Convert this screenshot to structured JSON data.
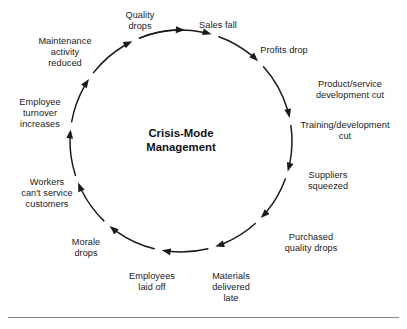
{
  "figure": {
    "background_color": "#ffffff",
    "stroke_color": "#1a1a1a",
    "text_color": "#1a1a1a"
  },
  "center": {
    "title": "Crisis-Mode\nManagement"
  },
  "chart_data": {
    "type": "diagram",
    "diagram_kind": "vicious-cycle-loop",
    "title": "Crisis-Mode Management",
    "direction": "clockwise",
    "node_count": 14,
    "circle": {
      "cx": 181,
      "cy": 141,
      "r": 111
    },
    "nodes": [
      {
        "label": "Quality\ndrops",
        "angle_deg": -70,
        "x": 112,
        "y": 10,
        "width": 56,
        "align": "center"
      },
      {
        "label": "Sales fall",
        "angle_deg": -48,
        "x": 187,
        "y": 20,
        "width": 62,
        "align": "center"
      },
      {
        "label": "Profits drop",
        "angle_deg": -22,
        "x": 249,
        "y": 45,
        "width": 70,
        "align": "center"
      },
      {
        "label": "Product/service\ndevelopment cut",
        "angle_deg": 2,
        "x": 302,
        "y": 79,
        "width": 96,
        "align": "center"
      },
      {
        "label": "Training/development\ncut",
        "angle_deg": 20,
        "x": 289,
        "y": 120,
        "width": 112,
        "align": "center"
      },
      {
        "label": "Suppliers\nsqueezed",
        "angle_deg": 44,
        "x": 298,
        "y": 170,
        "width": 60,
        "align": "center"
      },
      {
        "label": "Purchased\nquality drops",
        "angle_deg": 68,
        "x": 272,
        "y": 232,
        "width": 78,
        "align": "center"
      },
      {
        "label": "Materials\ndelivered\nlate",
        "angle_deg": 96,
        "x": 202,
        "y": 271,
        "width": 58,
        "align": "center"
      },
      {
        "label": "Employees\nlaid off",
        "angle_deg": 118,
        "x": 119,
        "y": 271,
        "width": 66,
        "align": "center"
      },
      {
        "label": "Morale\ndrops",
        "angle_deg": 140,
        "x": 60,
        "y": 237,
        "width": 52,
        "align": "center"
      },
      {
        "label": "Workers\ncan't service\ncustomers",
        "angle_deg": 166,
        "x": 8,
        "y": 177,
        "width": 78,
        "align": "center"
      },
      {
        "label": "Employee\nturnover\nincreases",
        "angle_deg": 192,
        "x": 6,
        "y": 97,
        "width": 68,
        "align": "center"
      },
      {
        "label": "Maintenance\nactivity\nreduced",
        "angle_deg": 218,
        "x": 27,
        "y": 36,
        "width": 76,
        "align": "center"
      }
    ],
    "arrow_segments": [
      {
        "from_deg": -112,
        "to_deg": -74
      },
      {
        "from_deg": -70,
        "to_deg": -46
      },
      {
        "from_deg": -42,
        "to_deg": -12
      },
      {
        "from_deg": -8,
        "to_deg": 16
      },
      {
        "from_deg": 20,
        "to_deg": 44
      },
      {
        "from_deg": 48,
        "to_deg": 72
      },
      {
        "from_deg": 76,
        "to_deg": 100
      },
      {
        "from_deg": 104,
        "to_deg": 130
      },
      {
        "from_deg": 134,
        "to_deg": 158
      },
      {
        "from_deg": 162,
        "to_deg": 186
      },
      {
        "from_deg": 190,
        "to_deg": 214
      },
      {
        "from_deg": 218,
        "to_deg": 244
      },
      {
        "from_deg": 248,
        "to_deg": 272
      }
    ]
  },
  "bottom_rule": {
    "x": 8,
    "y": 317,
    "width": 391,
    "color": "#8a8a8a"
  }
}
